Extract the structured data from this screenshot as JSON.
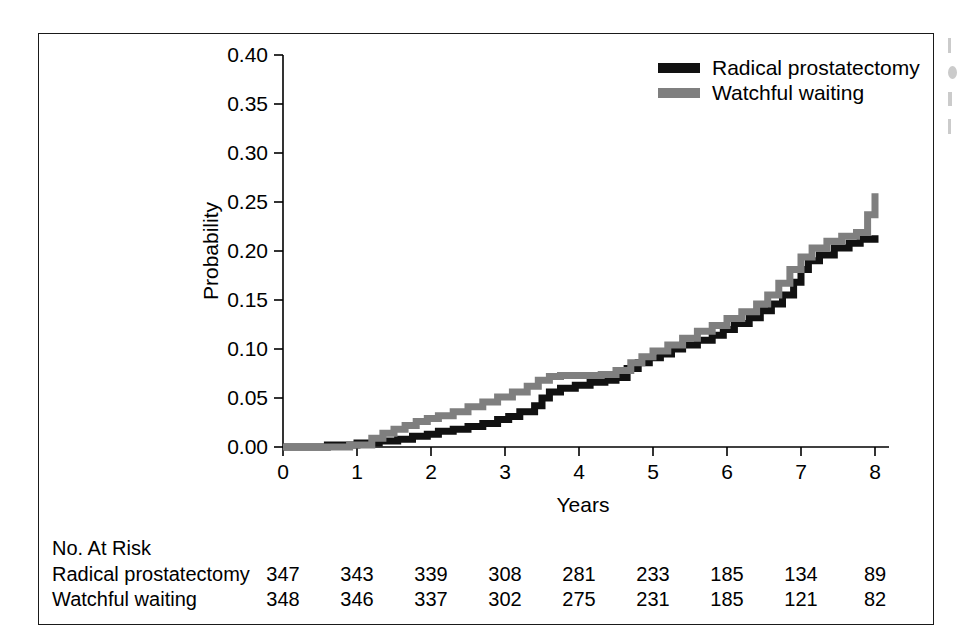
{
  "chart_data": {
    "type": "line",
    "title": "",
    "xlabel": "Years",
    "ylabel": "Probability",
    "xlim": [
      0,
      8
    ],
    "ylim": [
      0,
      0.4
    ],
    "grid": false,
    "legend_position": "top-right",
    "xticks": [
      "0",
      "1",
      "2",
      "3",
      "4",
      "5",
      "6",
      "7",
      "8"
    ],
    "xtick_values": [
      0,
      1,
      2,
      3,
      4,
      5,
      6,
      7,
      8
    ],
    "yticks": [
      "0.00",
      "0.05",
      "0.10",
      "0.15",
      "0.20",
      "0.25",
      "0.30",
      "0.35",
      "0.40"
    ],
    "ytick_values": [
      0,
      0.05,
      0.1,
      0.15,
      0.2,
      0.25,
      0.3,
      0.35,
      0.4
    ],
    "series": [
      {
        "name": "Radical prostatectomy",
        "color": "#111111",
        "step": "post",
        "x": [
          0,
          0.6,
          1.0,
          1.3,
          1.55,
          1.75,
          1.95,
          2.1,
          2.3,
          2.5,
          2.7,
          2.9,
          3.05,
          3.2,
          3.4,
          3.5,
          3.6,
          3.75,
          3.95,
          4.15,
          4.35,
          4.5,
          4.65,
          4.8,
          4.95,
          5.1,
          5.25,
          5.4,
          5.6,
          5.8,
          5.95,
          6.1,
          6.3,
          6.45,
          6.6,
          6.75,
          6.9,
          7.0,
          7.1,
          7.25,
          7.45,
          7.65,
          7.8,
          8.0
        ],
        "y": [
          0.0,
          0.002,
          0.004,
          0.006,
          0.008,
          0.011,
          0.013,
          0.016,
          0.018,
          0.021,
          0.024,
          0.028,
          0.031,
          0.036,
          0.042,
          0.05,
          0.056,
          0.06,
          0.063,
          0.066,
          0.068,
          0.071,
          0.08,
          0.086,
          0.091,
          0.095,
          0.1,
          0.104,
          0.109,
          0.114,
          0.12,
          0.126,
          0.132,
          0.139,
          0.146,
          0.155,
          0.168,
          0.181,
          0.19,
          0.196,
          0.203,
          0.208,
          0.212,
          0.216
        ]
      },
      {
        "name": "Watchful waiting",
        "color": "#7f7f7f",
        "step": "post",
        "x": [
          0,
          0.9,
          1.2,
          1.35,
          1.5,
          1.65,
          1.8,
          1.95,
          2.1,
          2.3,
          2.5,
          2.7,
          2.9,
          3.1,
          3.3,
          3.45,
          3.6,
          3.75,
          3.9,
          4.1,
          4.3,
          4.5,
          4.7,
          4.85,
          5.0,
          5.2,
          5.4,
          5.6,
          5.8,
          6.0,
          6.2,
          6.4,
          6.55,
          6.7,
          6.85,
          7.0,
          7.15,
          7.35,
          7.55,
          7.75,
          7.9,
          8.0
        ],
        "y": [
          0.0,
          0.002,
          0.009,
          0.014,
          0.018,
          0.022,
          0.026,
          0.029,
          0.032,
          0.036,
          0.041,
          0.046,
          0.051,
          0.056,
          0.062,
          0.068,
          0.072,
          0.073,
          0.073,
          0.073,
          0.074,
          0.078,
          0.086,
          0.092,
          0.098,
          0.104,
          0.111,
          0.118,
          0.124,
          0.131,
          0.138,
          0.146,
          0.155,
          0.167,
          0.181,
          0.194,
          0.203,
          0.21,
          0.215,
          0.219,
          0.237,
          0.259
        ]
      }
    ]
  },
  "legend": {
    "items": [
      {
        "label": "Radical prostatectomy",
        "color": "#111111"
      },
      {
        "label": "Watchful waiting",
        "color": "#7f7f7f"
      }
    ]
  },
  "risk_table": {
    "title": "No. At Risk",
    "rows": [
      {
        "label": "Radical prostatectomy",
        "values": [
          "347",
          "343",
          "339",
          "308",
          "281",
          "233",
          "185",
          "134",
          "89"
        ]
      },
      {
        "label": "Watchful waiting",
        "values": [
          "348",
          "346",
          "337",
          "302",
          "275",
          "231",
          "185",
          "121",
          "82"
        ]
      }
    ]
  }
}
